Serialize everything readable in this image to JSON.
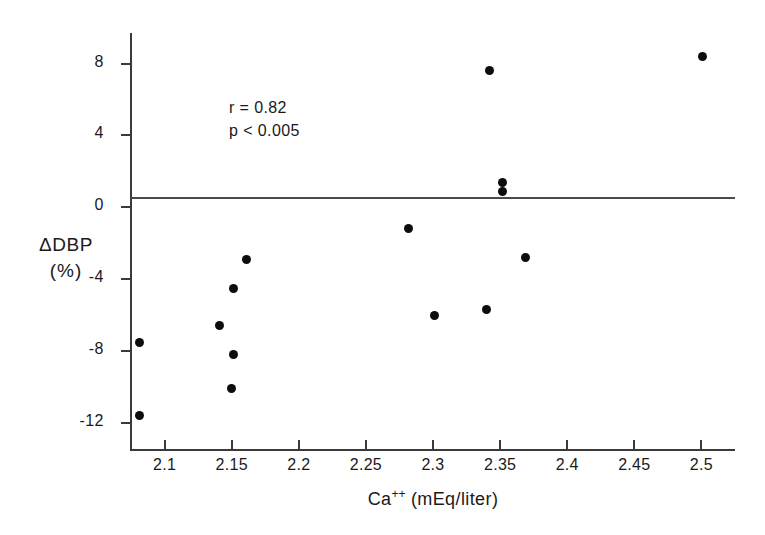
{
  "chart_data": {
    "type": "scatter",
    "title": "",
    "xlabel": "Ca++ (mEq/liter)",
    "xlabel_base": "Ca",
    "xlabel_sup": "++",
    "xlabel_rest": " (mEq/liter)",
    "ylabel": "ΔDBP",
    "ylabel_unit": "(%)",
    "xlim": [
      2.075,
      2.525
    ],
    "ylim": [
      -13.5,
      9.7
    ],
    "grid": false,
    "legend": null,
    "xticks": [
      2.1,
      2.15,
      2.2,
      2.25,
      2.3,
      2.35,
      2.4,
      2.45,
      2.5
    ],
    "xtick_labels": [
      "2.1",
      "2.15",
      "2.2",
      "2.25",
      "2.3",
      "2.35",
      "2.4",
      "2.45",
      "2.5"
    ],
    "yticks": [
      8,
      4,
      0,
      -4,
      -8,
      -12
    ],
    "ytick_labels": [
      "8",
      "4",
      "0",
      "-4",
      "-8",
      "-12"
    ],
    "reference_lines": [
      {
        "axis": "y",
        "value": 0
      }
    ],
    "annotations": [
      {
        "text": "r = 0.82",
        "x": 2.185,
        "y": 6.2
      },
      {
        "text": "p < 0.005",
        "x": 2.185,
        "y": 4.6
      }
    ],
    "points": [
      {
        "x": 2.081,
        "y": -7.5
      },
      {
        "x": 2.081,
        "y": -11.6
      },
      {
        "x": 2.161,
        "y": -2.9
      },
      {
        "x": 2.151,
        "y": -4.5
      },
      {
        "x": 2.141,
        "y": -6.6
      },
      {
        "x": 2.151,
        "y": -8.2
      },
      {
        "x": 2.15,
        "y": -10.1
      },
      {
        "x": 2.282,
        "y": -1.2
      },
      {
        "x": 2.342,
        "y": 7.6
      },
      {
        "x": 2.352,
        "y": 1.4
      },
      {
        "x": 2.352,
        "y": 0.9
      },
      {
        "x": 2.369,
        "y": -2.8
      },
      {
        "x": 2.301,
        "y": -6.0
      },
      {
        "x": 2.34,
        "y": -5.7
      },
      {
        "x": 2.501,
        "y": 8.4
      }
    ]
  },
  "figure": {
    "r_label": "r = 0.82",
    "p_label": "p < 0.005"
  }
}
